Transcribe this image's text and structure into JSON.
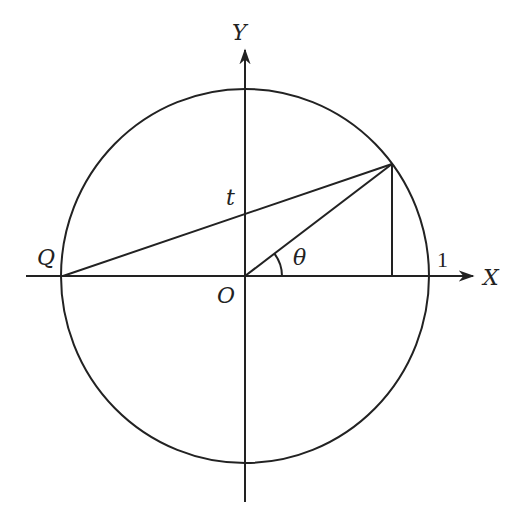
{
  "diagram": {
    "type": "unit-circle",
    "labels": {
      "y_axis": "Y",
      "x_axis": "X",
      "origin": "O",
      "point_q": "Q",
      "intercept": "t",
      "angle": "θ",
      "radius_mark": "1"
    },
    "colors": {
      "stroke": "#222222",
      "background": "#ffffff"
    }
  }
}
